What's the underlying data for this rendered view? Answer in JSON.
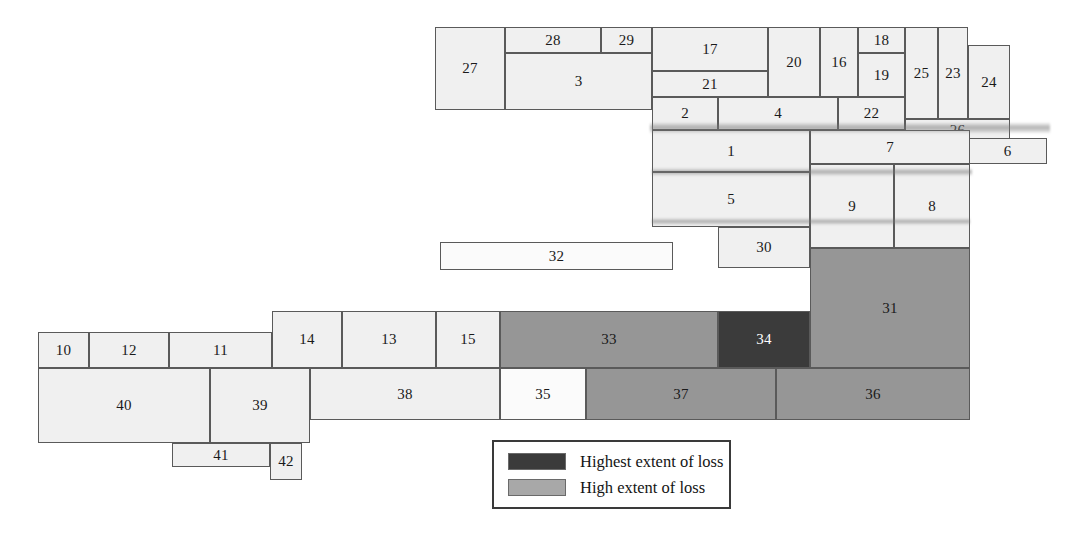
{
  "figure": {
    "type": "treemap-cartogram",
    "colors": {
      "light": "#f0f0f0",
      "white": "#fbfbfb",
      "mid": "#969696",
      "dark": "#3b3b3b",
      "stroke": "#5a5a5a",
      "background": "#ffffff"
    }
  },
  "legend": {
    "box": {
      "x": 492,
      "y": 440,
      "w": 239,
      "h": 69
    },
    "items": [
      {
        "label": "Highest extent of loss",
        "shade": "dark",
        "swatch": "#3b3b3b"
      },
      {
        "label": "High extent of loss",
        "shade": "mid",
        "swatch": "#a8a8a8"
      }
    ]
  },
  "cells": [
    {
      "label": "27",
      "x": 435,
      "y": 27,
      "w": 70,
      "h": 83,
      "shade": "light"
    },
    {
      "label": "28",
      "x": 505,
      "y": 27,
      "w": 96,
      "h": 26,
      "shade": "light"
    },
    {
      "label": "29",
      "x": 601,
      "y": 27,
      "w": 51,
      "h": 26,
      "shade": "light"
    },
    {
      "label": "3",
      "x": 505,
      "y": 53,
      "w": 147,
      "h": 57,
      "shade": "light"
    },
    {
      "label": "17",
      "x": 652,
      "y": 27,
      "w": 116,
      "h": 44,
      "shade": "light"
    },
    {
      "label": "21",
      "x": 652,
      "y": 71,
      "w": 116,
      "h": 26,
      "shade": "light"
    },
    {
      "label": "20",
      "x": 768,
      "y": 27,
      "w": 52,
      "h": 70,
      "shade": "light"
    },
    {
      "label": "16",
      "x": 820,
      "y": 27,
      "w": 38,
      "h": 70,
      "shade": "light"
    },
    {
      "label": "18",
      "x": 858,
      "y": 27,
      "w": 47,
      "h": 26,
      "shade": "light"
    },
    {
      "label": "19",
      "x": 858,
      "y": 53,
      "w": 47,
      "h": 44,
      "shade": "light"
    },
    {
      "label": "25",
      "x": 905,
      "y": 27,
      "w": 33,
      "h": 92,
      "shade": "light"
    },
    {
      "label": "23",
      "x": 938,
      "y": 27,
      "w": 30,
      "h": 92,
      "shade": "light"
    },
    {
      "label": "24",
      "x": 968,
      "y": 45,
      "w": 42,
      "h": 74,
      "shade": "light"
    },
    {
      "label": "2",
      "x": 652,
      "y": 97,
      "w": 66,
      "h": 33,
      "shade": "light"
    },
    {
      "label": "4",
      "x": 718,
      "y": 97,
      "w": 120,
      "h": 33,
      "shade": "light"
    },
    {
      "label": "22",
      "x": 838,
      "y": 97,
      "w": 67,
      "h": 33,
      "shade": "light"
    },
    {
      "label": "26",
      "x": 905,
      "y": 119,
      "w": 105,
      "h": 23,
      "shade": "light"
    },
    {
      "label": "6",
      "x": 968,
      "y": 138,
      "w": 79,
      "h": 26,
      "shade": "light"
    },
    {
      "label": "1",
      "x": 652,
      "y": 130,
      "w": 158,
      "h": 42,
      "shade": "light"
    },
    {
      "label": "7",
      "x": 810,
      "y": 130,
      "w": 160,
      "h": 34,
      "shade": "light"
    },
    {
      "label": "5",
      "x": 652,
      "y": 172,
      "w": 158,
      "h": 55,
      "shade": "light"
    },
    {
      "label": "9",
      "x": 810,
      "y": 164,
      "w": 84,
      "h": 84,
      "shade": "light"
    },
    {
      "label": "8",
      "x": 894,
      "y": 164,
      "w": 76,
      "h": 84,
      "shade": "light"
    },
    {
      "label": "30",
      "x": 718,
      "y": 227,
      "w": 92,
      "h": 41,
      "shade": "light"
    },
    {
      "label": "31",
      "x": 810,
      "y": 248,
      "w": 160,
      "h": 120,
      "shade": "mid"
    },
    {
      "label": "32",
      "x": 440,
      "y": 242,
      "w": 233,
      "h": 28,
      "shade": "white"
    },
    {
      "label": "10",
      "x": 38,
      "y": 332,
      "w": 51,
      "h": 36,
      "shade": "light"
    },
    {
      "label": "12",
      "x": 89,
      "y": 332,
      "w": 80,
      "h": 36,
      "shade": "light"
    },
    {
      "label": "11",
      "x": 169,
      "y": 332,
      "w": 103,
      "h": 36,
      "shade": "light"
    },
    {
      "label": "14",
      "x": 272,
      "y": 311,
      "w": 70,
      "h": 57,
      "shade": "light"
    },
    {
      "label": "13",
      "x": 342,
      "y": 311,
      "w": 94,
      "h": 57,
      "shade": "light"
    },
    {
      "label": "15",
      "x": 436,
      "y": 311,
      "w": 64,
      "h": 57,
      "shade": "light"
    },
    {
      "label": "33",
      "x": 500,
      "y": 311,
      "w": 218,
      "h": 57,
      "shade": "mid"
    },
    {
      "label": "34",
      "x": 718,
      "y": 311,
      "w": 92,
      "h": 57,
      "shade": "dark"
    },
    {
      "label": "40",
      "x": 38,
      "y": 368,
      "w": 172,
      "h": 75,
      "shade": "light"
    },
    {
      "label": "39",
      "x": 210,
      "y": 368,
      "w": 100,
      "h": 75,
      "shade": "light"
    },
    {
      "label": "38",
      "x": 310,
      "y": 368,
      "w": 190,
      "h": 52,
      "shade": "light"
    },
    {
      "label": "35",
      "x": 500,
      "y": 368,
      "w": 86,
      "h": 52,
      "shade": "white"
    },
    {
      "label": "37",
      "x": 586,
      "y": 368,
      "w": 190,
      "h": 52,
      "shade": "mid"
    },
    {
      "label": "36",
      "x": 776,
      "y": 368,
      "w": 194,
      "h": 52,
      "shade": "mid"
    },
    {
      "label": "41",
      "x": 172,
      "y": 443,
      "w": 98,
      "h": 24,
      "shade": "light"
    },
    {
      "label": "42",
      "x": 270,
      "y": 443,
      "w": 32,
      "h": 37,
      "shade": "light"
    }
  ],
  "scan_artifacts": [
    {
      "x": 650,
      "y": 122,
      "w": 400,
      "h": 12
    },
    {
      "x": 652,
      "y": 168,
      "w": 320,
      "h": 8
    },
    {
      "x": 652,
      "y": 218,
      "w": 318,
      "h": 7
    }
  ]
}
